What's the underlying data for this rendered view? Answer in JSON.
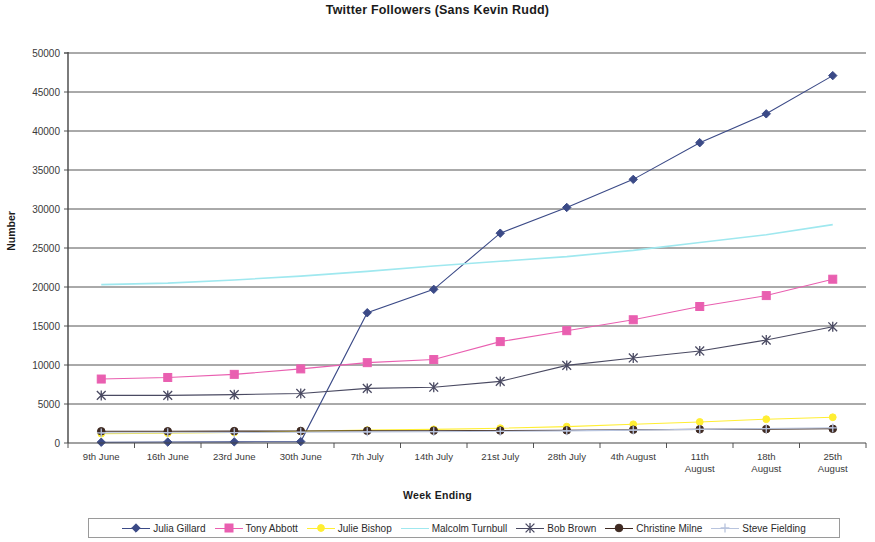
{
  "chart_data": {
    "type": "line",
    "title": "Twitter Followers (Sans Kevin Rudd)",
    "xlabel": "Week Ending",
    "ylabel": "Number",
    "ylim": [
      0,
      50000
    ],
    "ytick_step": 5000,
    "yticks": [
      "0",
      "5000",
      "10000",
      "15000",
      "20000",
      "25000",
      "30000",
      "35000",
      "40000",
      "45000",
      "50000"
    ],
    "grid": true,
    "legend_position": "bottom",
    "categories": [
      "9th June",
      "16th June",
      "23rd June",
      "30th June",
      "7th July",
      "14th July",
      "21st July",
      "28th July",
      "4th August",
      "11th August",
      "18th August",
      "25th August"
    ],
    "series": [
      {
        "name": "Julia Gillard",
        "color": "#3b4a87",
        "marker": "diamond",
        "values": [
          100,
          120,
          150,
          180,
          16700,
          19700,
          26900,
          30200,
          33800,
          38500,
          42200,
          47100
        ]
      },
      {
        "name": "Tony Abbott",
        "color": "#e95fb0",
        "marker": "square",
        "values": [
          8200,
          8400,
          8800,
          9500,
          10300,
          10700,
          13000,
          14400,
          15800,
          17500,
          18900,
          21000
        ]
      },
      {
        "name": "Julie Bishop",
        "color": "#ffee33",
        "marker": "dot",
        "values": [
          1200,
          1250,
          1350,
          1500,
          1650,
          1750,
          1900,
          2100,
          2400,
          2700,
          3050,
          3300
        ]
      },
      {
        "name": "Malcolm Turnbull",
        "color": "#9fe8ef",
        "marker": "none",
        "values": [
          20300,
          20500,
          20900,
          21400,
          22000,
          22700,
          23300,
          23900,
          24700,
          25700,
          26700,
          28000
        ]
      },
      {
        "name": "Bob Brown",
        "color": "#4a4a62",
        "marker": "star",
        "values": [
          6100,
          6100,
          6200,
          6350,
          7000,
          7150,
          7900,
          9950,
          10900,
          11800,
          13200,
          14900
        ]
      },
      {
        "name": "Christine Milne",
        "color": "#3f2a22",
        "marker": "circle",
        "values": [
          1500,
          1500,
          1520,
          1540,
          1560,
          1580,
          1600,
          1620,
          1700,
          1750,
          1780,
          1820
        ]
      },
      {
        "name": "Steve Fielding",
        "color": "#b8c4de",
        "marker": "plus",
        "values": [
          1300,
          1320,
          1340,
          1380,
          1420,
          1450,
          1500,
          1550,
          1650,
          1750,
          1850,
          1950
        ]
      }
    ]
  },
  "legend": {
    "items": [
      {
        "label": "Julia Gillard"
      },
      {
        "label": "Tony Abbott"
      },
      {
        "label": "Julie Bishop"
      },
      {
        "label": "Malcolm Turnbull"
      },
      {
        "label": "Bob Brown"
      },
      {
        "label": "Christine Milne"
      },
      {
        "label": "Steve Fielding"
      }
    ]
  }
}
